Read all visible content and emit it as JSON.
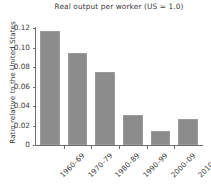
{
  "chart_data": {
    "type": "bar",
    "title": "Real output per worker (US = 1.0)",
    "xlabel": "",
    "ylabel": "Ratio relative to the United States",
    "categories": [
      "1960–69",
      "1970–79",
      "1980–89",
      "1990–99",
      "2000–09",
      "2010–17"
    ],
    "values": [
      0.117,
      0.094,
      0.075,
      0.031,
      0.014,
      0.027
    ],
    "series": [
      {
        "name": "Real output per worker",
        "values": [
          0.117,
          0.094,
          0.075,
          0.031,
          0.014,
          0.027
        ]
      }
    ],
    "ylim": [
      0,
      0.12
    ],
    "ytick_labels": [
      "0",
      "0.02",
      "0.04",
      "0.06",
      "0.08",
      "0.10",
      "0.12"
    ],
    "ytick_values": [
      0,
      0.02,
      0.04,
      0.06,
      0.08,
      0.1,
      0.12
    ],
    "grid": false,
    "legend": false,
    "legend_position": "none",
    "bar_color": "#8c8c8c",
    "axis_color": "#6e6e6e",
    "text_color": "#3d3d3d",
    "background": "#ffffff"
  }
}
